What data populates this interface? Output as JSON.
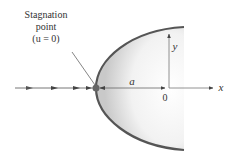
{
  "diagram": {
    "labels": {
      "stagnation_line1": "Stagnation",
      "stagnation_line2": "point",
      "stagnation_line3": "(u = 0)",
      "distance": "a",
      "origin": "0",
      "x_axis": "x",
      "y_axis": "y"
    },
    "colors": {
      "body_outline": "#555555",
      "stream_line": "#777777",
      "text": "#333333"
    }
  }
}
